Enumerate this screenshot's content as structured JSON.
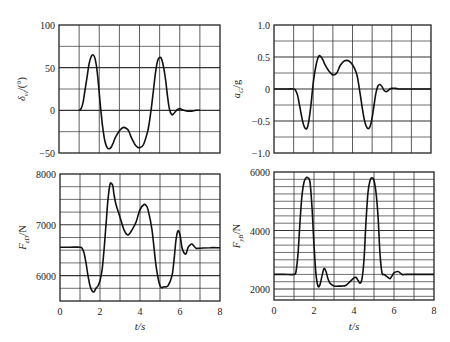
{
  "figure": {
    "xlabel_left": "t/s",
    "xlabel_right": "t/s"
  },
  "chart_data": [
    {
      "id": "steer",
      "type": "line",
      "title": "",
      "xlabel": "",
      "ylabel": "δvl/(°)",
      "ylabel_main": "δ",
      "ylabel_sub": "vl",
      "ylabel_unit": "/(°)",
      "xlim": [
        0,
        8
      ],
      "ylim": [
        -50,
        100
      ],
      "yticks": [
        -50,
        0,
        50,
        100
      ],
      "yticklabels": [
        "−50",
        "0",
        "50",
        "100"
      ],
      "xticks": [],
      "grid_x_step": 1,
      "grid_y_step": 25,
      "frame": {
        "x0": 59,
        "y0": 25,
        "x1": 220,
        "y1": 153
      },
      "x": [
        1.0,
        1.1,
        1.2,
        1.3,
        1.4,
        1.5,
        1.6,
        1.7,
        1.8,
        1.9,
        2.0,
        2.1,
        2.2,
        2.3,
        2.4,
        2.5,
        2.6,
        2.7,
        2.8,
        3.0,
        3.2,
        3.4,
        3.5,
        3.6,
        3.8,
        4.0,
        4.2,
        4.4,
        4.5,
        4.6,
        4.7,
        4.8,
        4.9,
        5.0,
        5.1,
        5.2,
        5.3,
        5.4,
        5.5,
        5.6,
        5.7,
        5.8,
        5.9,
        6.0,
        6.2,
        6.4,
        6.6,
        6.8,
        7.0
      ],
      "values": [
        0,
        2,
        10,
        25,
        40,
        55,
        63,
        65,
        60,
        45,
        20,
        -5,
        -25,
        -38,
        -44,
        -45,
        -43,
        -38,
        -32,
        -24,
        -20,
        -22,
        -26,
        -32,
        -41,
        -44,
        -40,
        -25,
        -12,
        5,
        25,
        45,
        58,
        62,
        60,
        50,
        35,
        15,
        0,
        -5,
        -4,
        -1,
        1,
        2,
        0,
        -1,
        -1,
        0,
        0
      ]
    },
    {
      "id": "accel",
      "type": "line",
      "title": "",
      "xlabel": "",
      "ylabel": "aG/g",
      "ylabel_main": "a",
      "ylabel_sub": "G",
      "ylabel_unit": "/g",
      "xlim": [
        0,
        8
      ],
      "ylim": [
        -1.0,
        1.0
      ],
      "yticks": [
        -1.0,
        -0.5,
        0,
        0.5,
        1.0
      ],
      "yticklabels": [
        "−1.0",
        "−0.5",
        "0",
        "0.5",
        "1.0"
      ],
      "xticks": [],
      "grid_x_step": 1,
      "grid_y_step": 0.25,
      "frame": {
        "x0": 274,
        "y0": 25,
        "x1": 431,
        "y1": 153
      },
      "x": [
        0,
        0.5,
        1.0,
        1.1,
        1.2,
        1.3,
        1.4,
        1.5,
        1.6,
        1.7,
        1.8,
        1.9,
        2.0,
        2.1,
        2.2,
        2.3,
        2.4,
        2.5,
        2.6,
        2.8,
        3.0,
        3.2,
        3.3,
        3.4,
        3.6,
        3.8,
        4.0,
        4.2,
        4.3,
        4.4,
        4.5,
        4.6,
        4.7,
        4.8,
        4.9,
        5.0,
        5.1,
        5.2,
        5.3,
        5.4,
        5.5,
        5.6,
        5.7,
        5.8,
        5.9,
        6.0,
        6.2,
        6.4,
        6.6,
        7.0,
        8.0
      ],
      "values": [
        0,
        0,
        0,
        -0.02,
        -0.1,
        -0.25,
        -0.42,
        -0.55,
        -0.62,
        -0.6,
        -0.45,
        -0.2,
        0.1,
        0.3,
        0.45,
        0.52,
        0.5,
        0.45,
        0.38,
        0.28,
        0.22,
        0.25,
        0.32,
        0.38,
        0.44,
        0.44,
        0.38,
        0.25,
        0.1,
        -0.1,
        -0.3,
        -0.48,
        -0.58,
        -0.62,
        -0.58,
        -0.45,
        -0.25,
        -0.05,
        0.05,
        0.07,
        0.04,
        -0.02,
        -0.04,
        -0.03,
        0.0,
        0.01,
        0.01,
        0,
        0,
        0,
        0
      ]
    },
    {
      "id": "force-zd",
      "type": "line",
      "title": "",
      "xlabel": "t/s",
      "ylabel": "FzD/N",
      "ylabel_main": "F",
      "ylabel_sub": "zD",
      "ylabel_unit": "/N",
      "xlim": [
        0,
        8
      ],
      "ylim": [
        5500,
        8000
      ],
      "yticks": [
        6000,
        7000,
        8000
      ],
      "yticklabels": [
        "6000",
        "7000",
        "8000"
      ],
      "xticks": [
        0,
        2,
        4,
        6,
        8
      ],
      "xticklabels": [
        "0",
        "2",
        "4",
        "6",
        "8"
      ],
      "grid_x_step": 1,
      "grid_y_step": 250,
      "frame": {
        "x0": 60,
        "y0": 174,
        "x1": 220,
        "y1": 301
      },
      "x": [
        0,
        0.5,
        1.0,
        1.1,
        1.2,
        1.3,
        1.4,
        1.5,
        1.6,
        1.7,
        1.8,
        1.9,
        2.0,
        2.1,
        2.2,
        2.3,
        2.4,
        2.5,
        2.6,
        2.65,
        2.7,
        2.8,
        3.0,
        3.2,
        3.4,
        3.6,
        3.8,
        4.0,
        4.2,
        4.3,
        4.4,
        4.6,
        4.8,
        5.0,
        5.2,
        5.4,
        5.6,
        5.7,
        5.8,
        5.9,
        6.0,
        6.1,
        6.2,
        6.3,
        6.4,
        6.5,
        6.6,
        6.7,
        6.8,
        7.0,
        7.5,
        8.0
      ],
      "values": [
        6560,
        6560,
        6560,
        6540,
        6450,
        6250,
        6000,
        5800,
        5700,
        5680,
        5750,
        5800,
        5900,
        6100,
        6500,
        7000,
        7500,
        7800,
        7800,
        7750,
        7600,
        7400,
        7150,
        6900,
        6800,
        6900,
        7050,
        7300,
        7400,
        7380,
        7300,
        6900,
        6200,
        5800,
        5780,
        5800,
        6000,
        6300,
        6700,
        6880,
        6800,
        6550,
        6450,
        6430,
        6550,
        6600,
        6620,
        6580,
        6540,
        6540,
        6550,
        6550
      ]
    },
    {
      "id": "force-yb",
      "type": "line",
      "title": "",
      "xlabel": "t/s",
      "ylabel": "FyB/N",
      "ylabel_main": "F",
      "ylabel_sub": "yB",
      "ylabel_unit": "/N",
      "xlim": [
        0,
        8
      ],
      "ylim": [
        1625,
        6000
      ],
      "yticks": [
        2000,
        4000,
        6000
      ],
      "yticklabels": [
        "2000",
        "4000",
        "6000"
      ],
      "xticks": [
        0,
        2,
        4,
        6,
        8
      ],
      "xticklabels": [
        "0",
        "2",
        "4",
        "6",
        "8"
      ],
      "grid_x_step": 1,
      "grid_y_step": 250,
      "frame": {
        "x0": 274,
        "y0": 172,
        "x1": 434,
        "y1": 300
      },
      "x": [
        0,
        0.5,
        1.0,
        1.1,
        1.2,
        1.3,
        1.4,
        1.5,
        1.6,
        1.7,
        1.8,
        1.9,
        2.0,
        2.1,
        2.2,
        2.3,
        2.4,
        2.5,
        2.6,
        2.7,
        2.8,
        3.0,
        3.2,
        3.4,
        3.6,
        3.8,
        4.0,
        4.1,
        4.2,
        4.3,
        4.4,
        4.5,
        4.6,
        4.7,
        4.8,
        4.9,
        5.0,
        5.1,
        5.2,
        5.3,
        5.4,
        5.5,
        5.6,
        5.7,
        5.8,
        5.9,
        6.0,
        6.2,
        6.4,
        6.6,
        7.0,
        8.0
      ],
      "values": [
        2500,
        2500,
        2500,
        2600,
        3200,
        4300,
        5200,
        5650,
        5800,
        5800,
        5650,
        4800,
        3500,
        2500,
        2100,
        2150,
        2450,
        2700,
        2600,
        2350,
        2200,
        2100,
        2100,
        2100,
        2130,
        2250,
        2380,
        2400,
        2300,
        2200,
        2350,
        3000,
        4300,
        5300,
        5700,
        5800,
        5700,
        5300,
        4500,
        3200,
        2550,
        2500,
        2450,
        2400,
        2350,
        2450,
        2550,
        2600,
        2500,
        2500,
        2500,
        2500
      ]
    }
  ]
}
